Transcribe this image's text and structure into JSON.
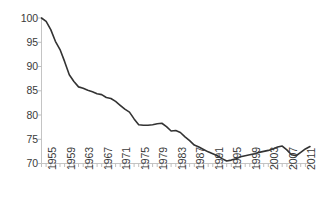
{
  "chart_data": {
    "type": "line",
    "title": "",
    "subtitle": "",
    "xlabel": "",
    "ylabel": "",
    "xlim": [
      1955,
      2013
    ],
    "ylim": [
      70,
      100
    ],
    "grid": false,
    "legend": null,
    "legend_position": "none",
    "line_color": "#333333",
    "axis_color": "#bfbfbf",
    "tick_color": "#bfbfbf",
    "label_color": "#3a3a3a",
    "y_ticks": [
      100,
      95,
      90,
      85,
      80,
      75,
      70
    ],
    "x_ticks": [
      1955,
      1959,
      1963,
      1967,
      1971,
      1975,
      1979,
      1983,
      1987,
      1991,
      1995,
      1999,
      2003,
      2007,
      2011
    ],
    "x_tick_labels": [
      "1955",
      "1959",
      "1963",
      "1967",
      "1971",
      "1975",
      "1979",
      "1983",
      "1987",
      "1991",
      "1995",
      "1999",
      "2003",
      "2007",
      "2011"
    ],
    "x": [
      1955,
      1956,
      1957,
      1958,
      1959,
      1960,
      1961,
      1962,
      1963,
      1964,
      1965,
      1966,
      1967,
      1968,
      1969,
      1970,
      1971,
      1972,
      1973,
      1974,
      1975,
      1976,
      1977,
      1978,
      1979,
      1980,
      1981,
      1982,
      1983,
      1984,
      1985,
      1986,
      1987,
      1988,
      1989,
      1990,
      1991,
      1992,
      1993,
      1994,
      1995,
      1996,
      1997,
      1998,
      1999,
      2000,
      2001,
      2002,
      2003,
      2004,
      2005,
      2006,
      2007,
      2008,
      2009,
      2010,
      2011,
      2012,
      2013
    ],
    "values": [
      100.0,
      99.3,
      97.6,
      95.2,
      93.5,
      91.0,
      88.3,
      86.9,
      85.8,
      85.5,
      85.1,
      84.8,
      84.4,
      84.2,
      83.6,
      83.4,
      82.8,
      82.0,
      81.2,
      80.6,
      79.2,
      78.0,
      77.9,
      77.9,
      78.0,
      78.2,
      78.3,
      77.6,
      76.7,
      76.8,
      76.4,
      75.5,
      74.7,
      73.8,
      73.4,
      72.9,
      72.4,
      72.0,
      71.6,
      71.0,
      70.5,
      70.7,
      71.0,
      71.4,
      71.6,
      71.8,
      72.0,
      72.3,
      72.5,
      72.7,
      73.0,
      73.4,
      73.6,
      72.8,
      71.8,
      71.6,
      72.3,
      73.0,
      73.5
    ],
    "series": [
      {
        "name": "series-1",
        "color": "#333333",
        "values": [
          100.0,
          99.3,
          97.6,
          95.2,
          93.5,
          91.0,
          88.3,
          86.9,
          85.8,
          85.5,
          85.1,
          84.8,
          84.4,
          84.2,
          83.6,
          83.4,
          82.8,
          82.0,
          81.2,
          80.6,
          79.2,
          78.0,
          77.9,
          77.9,
          78.0,
          78.2,
          78.3,
          77.6,
          76.7,
          76.8,
          76.4,
          75.5,
          74.7,
          73.8,
          73.4,
          72.9,
          72.4,
          72.0,
          71.6,
          71.0,
          70.5,
          70.7,
          71.0,
          71.4,
          71.6,
          71.8,
          72.0,
          72.3,
          72.5,
          72.7,
          73.0,
          73.4,
          73.6,
          72.8,
          71.8,
          71.6,
          72.3,
          73.0,
          73.5
        ]
      }
    ],
    "annotations": []
  },
  "axis": {
    "y_labels": [
      "100",
      "95",
      "90",
      "85",
      "80",
      "75",
      "70"
    ],
    "x_labels": [
      "1955",
      "1959",
      "1963",
      "1967",
      "1971",
      "1975",
      "1979",
      "1983",
      "1987",
      "1991",
      "1995",
      "1999",
      "2003",
      "2007",
      "2011"
    ]
  }
}
